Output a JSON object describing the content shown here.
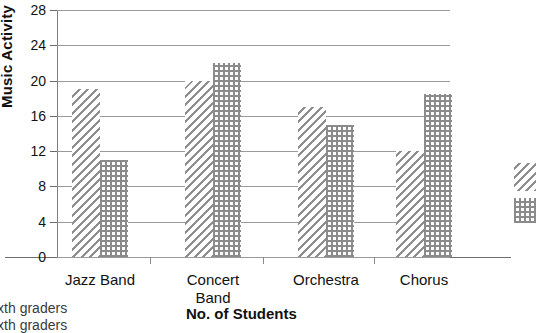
{
  "chart_data": {
    "type": "bar",
    "title": "",
    "categories": [
      "Jazz Band",
      "Concert\nBand",
      "Orchestra",
      "Chorus"
    ],
    "series": [
      {
        "name": "ixth graders",
        "pattern": "diagonal-hatch",
        "values": [
          19,
          20,
          17,
          12
        ]
      },
      {
        "name": "ixth graders",
        "pattern": "dotted-grid",
        "values": [
          11,
          22,
          15,
          18.5
        ]
      }
    ],
    "xlabel": "No. of Students",
    "ylabel": "Music Activity",
    "ylim": [
      0,
      28
    ],
    "ytick_labels": [
      "0",
      "4",
      "8",
      "12",
      "16",
      "20",
      "24",
      "28"
    ],
    "ytick_values": [
      0,
      4,
      8,
      12,
      16,
      20,
      24,
      28
    ],
    "grid": true,
    "legend_position": "right-edge-cropped"
  },
  "axis": {
    "y_title": "Music Activity",
    "x_title": "No. of Students"
  },
  "legend": {
    "items": [
      {
        "label": "ixth graders",
        "swatch": "diagonal-hatch-swatch"
      },
      {
        "label": "ixth graders",
        "swatch": "dotted-grid-swatch"
      }
    ]
  }
}
